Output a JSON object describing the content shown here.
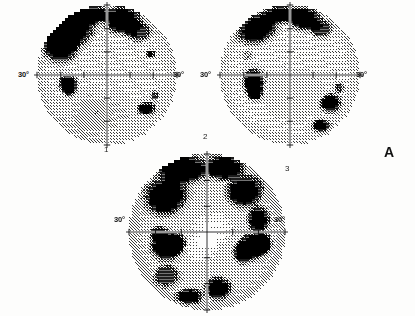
{
  "figure": {
    "panel_label": "A",
    "kind": "visual-field-grayscale-perimetry",
    "plot_count": 3
  },
  "plots": [
    {
      "id": "1",
      "number_label": "1",
      "left_axis_label": "30°",
      "right_axis_label": "30°",
      "center": [
        107,
        75
      ],
      "radius": 70,
      "eye_hint": "",
      "defects": "superior arcuate nasal defect, nasal step, small inferior-temporal spots"
    },
    {
      "id": "2",
      "number_label": "3",
      "left_axis_label": "30°",
      "right_axis_label": "30°",
      "center": [
        290,
        75
      ],
      "radius": 70,
      "eye_hint": "",
      "defects": "superior arcuate defect, dense nasal scotoma, inferior-temporal loss"
    },
    {
      "id": "3",
      "number_label": "2",
      "left_axis_label": "30°",
      "right_axis_label": "30°",
      "center": [
        207,
        232
      ],
      "radius": 78,
      "eye_hint": "",
      "defects": "dense superior band, bilateral mid-peripheral scotomata, inferior loss, sparing of central island"
    }
  ],
  "chart_data": {
    "type": "heatmap",
    "title": "",
    "xlabel": "",
    "ylabel": "",
    "legend": [],
    "grid": false,
    "axis_labels": [
      "30°",
      "30°"
    ],
    "scale": "grayscale deviation (light = normal sensitivity, dark = depressed sensitivity)",
    "grayscale_levels": [
      "#ffffff",
      "#e8e8e8",
      "#c9c9c9",
      "#a8a8a8",
      "#7d7d7d",
      "#4f4f4f",
      "#262626",
      "#000000"
    ],
    "panels": [
      {
        "name": "1",
        "center_deg": [
          0,
          0
        ],
        "radius_deg": 30,
        "regions": [
          {
            "label": "superior nasal arcuate",
            "quadrant": "upper-left",
            "darkness": 7
          },
          {
            "label": "superior temporal patch",
            "quadrant": "upper-right",
            "darkness": 6
          },
          {
            "label": "nasal step scotoma",
            "quadrant": "mid-left",
            "darkness": 7
          },
          {
            "label": "inferior temporal spot",
            "quadrant": "lower-right",
            "darkness": 6
          },
          {
            "label": "background",
            "quadrant": "all",
            "darkness": 2
          }
        ]
      },
      {
        "name": "3",
        "center_deg": [
          0,
          0
        ],
        "radius_deg": 30,
        "regions": [
          {
            "label": "superior arcuate band",
            "quadrant": "upper-left",
            "darkness": 7
          },
          {
            "label": "superior patch",
            "quadrant": "upper-right",
            "darkness": 6
          },
          {
            "label": "dense nasal scotoma",
            "quadrant": "mid-left",
            "darkness": 8
          },
          {
            "label": "inferior temporal loss",
            "quadrant": "lower-right",
            "darkness": 7
          },
          {
            "label": "background",
            "quadrant": "all",
            "darkness": 2
          }
        ]
      },
      {
        "name": "2",
        "center_deg": [
          0,
          0
        ],
        "radius_deg": 30,
        "regions": [
          {
            "label": "dense superior band",
            "quadrant": "superior",
            "darkness": 8
          },
          {
            "label": "left mid-peripheral scotoma",
            "quadrant": "mid-left",
            "darkness": 8
          },
          {
            "label": "right mid-peripheral scotoma",
            "quadrant": "mid-right",
            "darkness": 8
          },
          {
            "label": "inferior loss",
            "quadrant": "inferior",
            "darkness": 7
          },
          {
            "label": "central island spared",
            "quadrant": "center",
            "darkness": 1
          }
        ]
      }
    ]
  }
}
